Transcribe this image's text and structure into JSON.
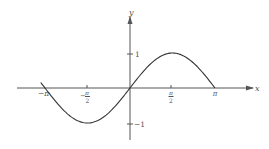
{
  "chart_data": {
    "type": "line",
    "title": "",
    "xlabel": "x",
    "ylabel": "y",
    "function": "y = sin(x)",
    "xlim": [
      -3.3,
      4.6
    ],
    "ylim": [
      -1.6,
      2.05
    ],
    "grid": false,
    "legend": null,
    "x_ticks": [
      {
        "value": -3.14159,
        "label": "-π"
      },
      {
        "value": -1.5708,
        "label": "-π/2"
      },
      {
        "value": 1.5708,
        "label": "π/2"
      },
      {
        "value": 3.14159,
        "label": "π"
      }
    ],
    "y_ticks": [
      {
        "value": 1,
        "label": "1"
      },
      {
        "value": -1,
        "label": "-1"
      }
    ],
    "series": [
      {
        "name": "sin(x)",
        "x": [
          -3.3,
          -3.14159,
          -2.356,
          -1.5708,
          -0.785,
          0,
          0.785,
          1.5708,
          2.356,
          3.14159
        ],
        "values": [
          0.158,
          0,
          -0.707,
          -1,
          -0.707,
          0,
          0.707,
          1,
          0.707,
          0
        ]
      }
    ]
  },
  "labels": {
    "x_axis": "x",
    "y_axis": "y",
    "neg_pi": "−π",
    "neg_half_pi_num": "π",
    "neg_half_pi_den": "2",
    "neg_sign": "−",
    "half_pi_num": "π",
    "half_pi_den": "2",
    "pi": "π",
    "one": "1",
    "neg_one": "−1"
  }
}
